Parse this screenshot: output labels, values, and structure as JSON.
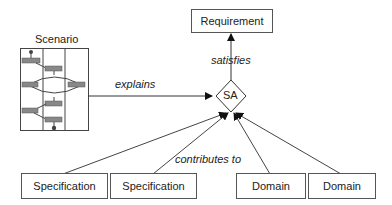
{
  "nodes": {
    "requirement": "Requirement",
    "sa": "SA",
    "scenario": "Scenario",
    "spec1": "Specification",
    "spec2": "Specification",
    "domain1": "Domain",
    "domain2": "Domain"
  },
  "edges": {
    "explains": "explains",
    "satisfies": "satisfies",
    "contributes": "contributes to"
  }
}
